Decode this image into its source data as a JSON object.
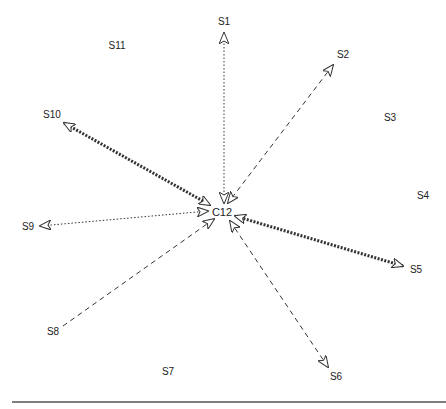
{
  "diagram": {
    "type": "star-network",
    "center": {
      "id": "C12",
      "label": "C12",
      "x": 222,
      "y": 212
    },
    "nodes": [
      {
        "id": "S1",
        "label": "S1",
        "x": 224,
        "y": 22
      },
      {
        "id": "S2",
        "label": "S2",
        "x": 343,
        "y": 55
      },
      {
        "id": "S3",
        "label": "S3",
        "x": 390,
        "y": 118
      },
      {
        "id": "S4",
        "label": "S4",
        "x": 423,
        "y": 196
      },
      {
        "id": "S5",
        "label": "S5",
        "x": 416,
        "y": 270
      },
      {
        "id": "S6",
        "label": "S6",
        "x": 336,
        "y": 377
      },
      {
        "id": "S7",
        "label": "S7",
        "x": 168,
        "y": 372
      },
      {
        "id": "S8",
        "label": "S8",
        "x": 53,
        "y": 332
      },
      {
        "id": "S9",
        "label": "S9",
        "x": 28,
        "y": 227
      },
      {
        "id": "S10",
        "label": "S10",
        "x": 52,
        "y": 115
      },
      {
        "id": "S11",
        "label": "S11",
        "x": 117,
        "y": 46
      }
    ],
    "edges": [
      {
        "from": "S1",
        "x1": 224,
        "y1": 33,
        "x2": 224,
        "y2": 203,
        "style": "dotted",
        "weight": "thin",
        "arrow_start": true,
        "arrow_end": true
      },
      {
        "from": "S2",
        "x1": 333,
        "y1": 65,
        "x2": 228,
        "y2": 203,
        "style": "dashed",
        "weight": "thin",
        "arrow_start": true,
        "arrow_end": true
      },
      {
        "from": "S5",
        "x1": 403,
        "y1": 266,
        "x2": 235,
        "y2": 216,
        "style": "dotted",
        "weight": "bold",
        "arrow_start": true,
        "arrow_end": true
      },
      {
        "from": "S6",
        "x1": 328,
        "y1": 367,
        "x2": 230,
        "y2": 221,
        "style": "dashed",
        "weight": "thin",
        "arrow_start": true,
        "arrow_end": true
      },
      {
        "from": "S8",
        "x1": 63,
        "y1": 326,
        "x2": 214,
        "y2": 219,
        "style": "dashed",
        "weight": "thin",
        "arrow_start": false,
        "arrow_end": true
      },
      {
        "from": "S9",
        "x1": 40,
        "y1": 226,
        "x2": 208,
        "y2": 211,
        "style": "dotted",
        "weight": "thin",
        "arrow_start": true,
        "arrow_end": true
      },
      {
        "from": "S10",
        "x1": 64,
        "y1": 123,
        "x2": 210,
        "y2": 205,
        "style": "dotted",
        "weight": "bold",
        "arrow_start": true,
        "arrow_end": true
      }
    ],
    "colors": {
      "line": "#333333",
      "arrow_fill": "#ffffff",
      "text": "#222222",
      "baseline": "#7f7f7f"
    }
  }
}
